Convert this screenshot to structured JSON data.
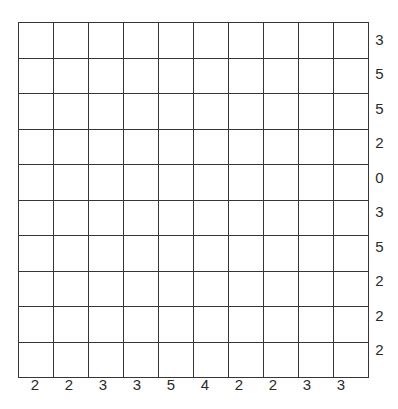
{
  "chart_data": {
    "type": "table",
    "title": "",
    "subtitle": "",
    "xlabel": "",
    "ylabel": "",
    "grid": true,
    "legend": null,
    "rows": 10,
    "columns": 10,
    "cell_values": [
      [
        "",
        "",
        "",
        "",
        "",
        "",
        "",
        "",
        "",
        ""
      ],
      [
        "",
        "",
        "",
        "",
        "",
        "",
        "",
        "",
        "",
        ""
      ],
      [
        "",
        "",
        "",
        "",
        "",
        "",
        "",
        "",
        "",
        ""
      ],
      [
        "",
        "",
        "",
        "",
        "",
        "",
        "",
        "",
        "",
        ""
      ],
      [
        "",
        "",
        "",
        "",
        "",
        "",
        "",
        "",
        "",
        ""
      ],
      [
        "",
        "",
        "",
        "",
        "",
        "",
        "",
        "",
        "",
        ""
      ],
      [
        "",
        "",
        "",
        "",
        "",
        "",
        "",
        "",
        "",
        ""
      ],
      [
        "",
        "",
        "",
        "",
        "",
        "",
        "",
        "",
        "",
        ""
      ],
      [
        "",
        "",
        "",
        "",
        "",
        "",
        "",
        "",
        "",
        ""
      ],
      [
        "",
        "",
        "",
        "",
        "",
        "",
        "",
        "",
        "",
        ""
      ]
    ],
    "row_labels": [
      "3",
      "5",
      "5",
      "2",
      "0",
      "3",
      "5",
      "2",
      "2",
      "2"
    ],
    "column_labels": [
      "2",
      "2",
      "3",
      "3",
      "5",
      "4",
      "2",
      "2",
      "3",
      "3"
    ],
    "row_label_position": "right",
    "column_label_position": "bottom",
    "colors": {
      "background": "#ffffff",
      "cell_fill": "#ffffff",
      "grid_line": "#363636",
      "label_text": "#2b2b2b"
    }
  }
}
